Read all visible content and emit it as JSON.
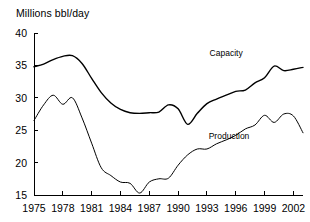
{
  "chart_data": {
    "type": "line",
    "title": "Millions bbl/day",
    "xlabel": "",
    "ylabel": "Millions bbl/day",
    "grid": false,
    "legend_position": "inline-annotation",
    "xlim": [
      1975,
      2003
    ],
    "ylim": [
      15,
      40
    ],
    "ytick_labels": [
      "15",
      "20",
      "25",
      "30",
      "35",
      "40"
    ],
    "yticks": [
      15,
      20,
      25,
      30,
      35,
      40
    ],
    "xtick_labels": [
      "1975",
      "1978",
      "1981",
      "1984",
      "1987",
      "1990",
      "1993",
      "1996",
      "1999",
      "2002"
    ],
    "xticks": [
      1975,
      1978,
      1981,
      1984,
      1987,
      1990,
      1993,
      1996,
      1999,
      2002
    ],
    "x": [
      1975,
      1976,
      1977,
      1978,
      1979,
      1980,
      1981,
      1982,
      1983,
      1984,
      1985,
      1986,
      1987,
      1988,
      1989,
      1990,
      1991,
      1992,
      1993,
      1994,
      1995,
      1996,
      1997,
      1998,
      1999,
      2000,
      2001,
      2002,
      2003
    ],
    "series": [
      {
        "name": "Capacity",
        "values": [
          34.8,
          35.2,
          35.9,
          36.4,
          36.5,
          35.3,
          33.0,
          30.8,
          29.2,
          28.2,
          27.7,
          27.6,
          27.7,
          27.8,
          28.9,
          28.3,
          25.9,
          27.6,
          29.1,
          29.8,
          30.4,
          31.0,
          31.2,
          32.3,
          33.1,
          34.9,
          34.2,
          34.4,
          34.7
        ],
        "label_text": "Capacity",
        "label_x": 1995.0,
        "label_y": 36.4,
        "stroke_width": 1.4
      },
      {
        "name": "Production",
        "values": [
          26.5,
          28.9,
          30.4,
          29.0,
          30.0,
          26.9,
          23.0,
          19.2,
          18.0,
          17.0,
          16.8,
          15.3,
          17.0,
          17.5,
          17.6,
          19.6,
          21.2,
          22.1,
          22.1,
          22.9,
          23.5,
          24.2,
          25.2,
          25.8,
          27.3,
          26.2,
          27.5,
          27.2,
          24.6
        ],
        "label_text": "Production",
        "label_x": 1995.3,
        "label_y": 23.6,
        "stroke_width": 1.0
      }
    ]
  }
}
